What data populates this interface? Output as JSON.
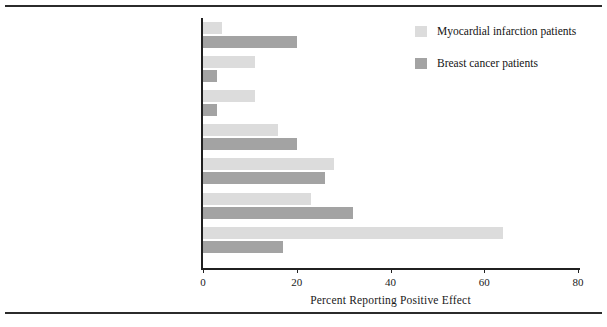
{
  "figure": {
    "top_rule": true,
    "bottom_rule": true,
    "background": "#ffffff"
  },
  "legend": {
    "position": "top-right",
    "entries": [
      {
        "label": "Myocardial infarction patients",
        "color": "#dcdcdc"
      },
      {
        "label": "Breast cancer patients",
        "color": "#a3a3a3"
      }
    ]
  },
  "axis": {
    "x_title": "Percent Reporting Positive Effect",
    "x_ticks": [
      "0",
      "20",
      "40",
      "60",
      "80"
    ],
    "x_tick_values": [
      0,
      20,
      40,
      60,
      80
    ],
    "x_min": 0,
    "x_max": 80
  },
  "chart_data": {
    "type": "bar",
    "orientation": "horizontal",
    "title": "",
    "xlabel": "Percent Reporting Positive Effect",
    "ylabel": "",
    "xlim": [
      0,
      80
    ],
    "grid": false,
    "legend_position": "top-right",
    "categories": [
      "Improved empathy",
      "Greater knowledge about health",
      "A second chance",
      "A change in personal life priorities",
      "Greater appreciation of health and life",
      "Improved close relationships",
      "Healthy lifestyle change"
    ],
    "series": [
      {
        "name": "Myocardial infarction patients",
        "color": "#dcdcdc",
        "values": [
          4,
          11,
          11,
          16,
          28,
          23,
          64
        ]
      },
      {
        "name": "Breast cancer patients",
        "color": "#a3a3a3",
        "values": [
          20,
          3,
          3,
          20,
          26,
          32,
          17
        ]
      }
    ]
  }
}
